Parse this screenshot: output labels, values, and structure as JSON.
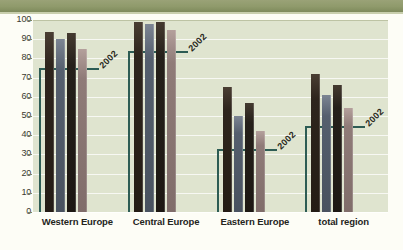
{
  "chart_data": {
    "type": "bar",
    "title": "",
    "xlabel": "",
    "ylabel": "",
    "ylim": [
      0,
      100
    ],
    "ytick_step": 10,
    "yticks": [
      0,
      10,
      20,
      30,
      40,
      50,
      60,
      70,
      80,
      90,
      100
    ],
    "grid": true,
    "legend": "none",
    "categories": [
      "Western Europe",
      "Central Europe",
      "Eastern Europe",
      "total region"
    ],
    "series": [
      {
        "name": "series-1",
        "color": "#241c15",
        "values": [
          94,
          99,
          65,
          72
        ]
      },
      {
        "name": "series-2",
        "color": "#49525f",
        "values": [
          90,
          98,
          50,
          61
        ]
      },
      {
        "name": "series-3",
        "color": "#1d1813",
        "values": [
          93,
          99,
          57,
          66
        ]
      },
      {
        "name": "series-4",
        "color": "#806d6a",
        "values": [
          85,
          95,
          42,
          54
        ]
      }
    ],
    "reference_lines": [
      {
        "label": "2002",
        "category": "Western Europe",
        "value": 75,
        "color": "#2d5c54"
      },
      {
        "label": "2002",
        "category": "Central Europe",
        "value": 84,
        "color": "#2d5c54"
      },
      {
        "label": "2002",
        "category": "Eastern Europe",
        "value": 33,
        "color": "#2d5c54"
      },
      {
        "label": "2002",
        "category": "total region",
        "value": 45,
        "color": "#2d5c54"
      }
    ]
  },
  "axis": {
    "ytick_labels": [
      "100",
      "90",
      "80",
      "70",
      "60",
      "50",
      "40",
      "30",
      "20",
      "10",
      "0"
    ]
  },
  "colors": {
    "banner": "#8f9a6b",
    "plot_background": "#dfe4cf",
    "page_background": "#fdfdf6",
    "reference": "#2d5c54",
    "gridline": "#ffffff"
  }
}
